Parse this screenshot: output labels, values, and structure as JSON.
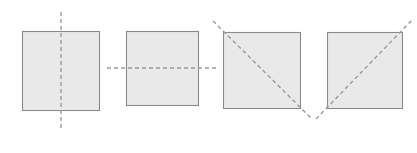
{
  "figure": {
    "width": 417,
    "height": 153,
    "background_color": "#ffffff"
  },
  "style": {
    "square_fill": "#e9e9e9",
    "square_stroke": "#8a8a8a",
    "dash_stroke": "#9a9a9a",
    "dash_pattern": "4 3",
    "watermark_color": "#f1f1f1"
  },
  "watermarks": [
    {
      "text": "preview",
      "x": 60,
      "y": 64,
      "size": 13,
      "rotation": 0
    },
    {
      "text": "sample",
      "x": 60,
      "y": 93,
      "size": 13,
      "rotation": 0
    },
    {
      "text": "preview",
      "x": 162,
      "y": 64,
      "size": 13,
      "rotation": 0
    },
    {
      "text": "sample",
      "x": 162,
      "y": 93,
      "size": 13,
      "rotation": 0
    },
    {
      "text": "preview",
      "x": 261,
      "y": 93,
      "size": 12,
      "rotation": 0
    },
    {
      "text": "preview",
      "x": 365,
      "y": 93,
      "size": 12,
      "rotation": 0
    }
  ],
  "shapes": [
    {
      "id": "square-1",
      "name": "square-vertical-symmetry",
      "label": "Square with vertical line of symmetry",
      "x": 22,
      "y": 31,
      "width": 77,
      "height": 79,
      "symmetry": {
        "type": "vertical",
        "label": "vertical line of symmetry",
        "x1": 61,
        "y1": 12,
        "x2": 61,
        "y2": 129
      }
    },
    {
      "id": "square-2",
      "name": "square-horizontal-symmetry",
      "label": "Square with horizontal line of symmetry",
      "x": 126,
      "y": 31,
      "width": 72,
      "height": 74,
      "symmetry": {
        "type": "horizontal",
        "label": "horizontal line of symmetry",
        "x1": 107,
        "y1": 68,
        "x2": 218,
        "y2": 68
      }
    },
    {
      "id": "square-3",
      "name": "square-diagonal-tl-br-symmetry",
      "label": "Square with diagonal line of symmetry from top left to bottom right",
      "x": 223,
      "y": 32,
      "width": 77,
      "height": 76,
      "symmetry": {
        "type": "diagonal-tl-br",
        "label": "diagonal line of symmetry top-left to bottom-right",
        "x1": 213,
        "y1": 21,
        "x2": 312,
        "y2": 119
      }
    },
    {
      "id": "square-4",
      "name": "square-diagonal-bl-tr-symmetry",
      "label": "Square with diagonal line of symmetry from bottom left to top right",
      "x": 327,
      "y": 32,
      "width": 75,
      "height": 76,
      "symmetry": {
        "type": "diagonal-bl-tr",
        "label": "diagonal line of symmetry bottom-left to top-right",
        "x1": 316,
        "y1": 119,
        "x2": 413,
        "y2": 19
      }
    }
  ]
}
